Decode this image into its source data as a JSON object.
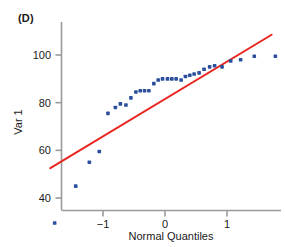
{
  "panel": {
    "label": "(D)"
  },
  "colors": {
    "points": "#2b4f9e",
    "line": "#e8251f",
    "axis": "#9a9a9a",
    "text": "#1a1a1a"
  },
  "chart_data": {
    "type": "scatter",
    "title": "(D)",
    "xlabel": "Normal Quantiles",
    "ylabel": "Var 1",
    "xlim": [
      -1.85,
      1.9
    ],
    "ylim": [
      28,
      108
    ],
    "xticks": [
      -1,
      0,
      1
    ],
    "xticklabels": [
      "−1",
      "0",
      "1"
    ],
    "yticks": [
      40,
      60,
      80,
      100
    ],
    "yticklabels": [
      "40",
      "60",
      "80",
      "100"
    ],
    "grid": false,
    "legend": null,
    "series": [
      {
        "name": "Var 1 vs Normal Quantiles",
        "marker": "square-dot",
        "color": "#2b4f9e",
        "x": [
          -1.78,
          -1.44,
          -1.22,
          -1.06,
          -0.92,
          -0.8,
          -0.72,
          -0.63,
          -0.55,
          -0.47,
          -0.4,
          -0.33,
          -0.26,
          -0.18,
          -0.11,
          -0.04,
          0.04,
          0.11,
          0.18,
          0.26,
          0.33,
          0.4,
          0.47,
          0.55,
          0.63,
          0.72,
          0.8,
          0.92,
          1.06,
          1.22,
          1.44,
          1.78
        ],
        "y": [
          29.5,
          45.0,
          55.0,
          59.5,
          75.5,
          78.0,
          79.5,
          79.0,
          82.0,
          84.5,
          85.0,
          85.0,
          85.0,
          88.0,
          89.5,
          90.0,
          90.0,
          90.0,
          90.0,
          89.5,
          91.0,
          91.5,
          92.0,
          92.5,
          94.0,
          95.0,
          95.5,
          95.0,
          97.5,
          98.0,
          99.5,
          99.5
        ]
      }
    ],
    "reference_line": {
      "name": "normal reference line",
      "color": "#e8251f",
      "x": [
        -1.85,
        1.72
      ],
      "y": [
        52.5,
        108.5
      ]
    }
  }
}
